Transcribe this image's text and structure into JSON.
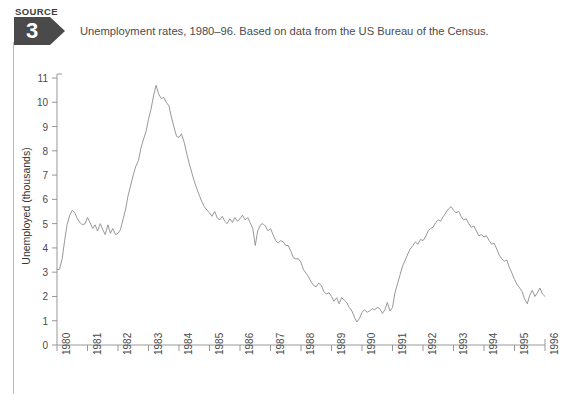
{
  "source_badge": {
    "word": "SOURCE",
    "number": "3"
  },
  "caption": "Unemployment rates, 1980–96. Based on data from the US Bureau of the Census.",
  "colors": {
    "badge": "#4a4a4a",
    "line": "#8c8c8c",
    "axis": "#8c8c8c",
    "text": "#4a4a4a",
    "rule": "#b9b9b9",
    "background": "#ffffff"
  },
  "chart_data": {
    "type": "line",
    "title": "Unemployment rates, 1980–96. Based on data from the US Bureau of the Census.",
    "xlabel": "",
    "ylabel": "Unemployed (thousands)",
    "xlim": [
      1980,
      1996
    ],
    "ylim": [
      0,
      11
    ],
    "grid": false,
    "legend": false,
    "ytick_labels": [
      "0",
      "1",
      "2",
      "3",
      "4",
      "5",
      "6",
      "7",
      "8",
      "9",
      "10",
      "11"
    ],
    "ytick_values": [
      0,
      1,
      2,
      3,
      4,
      5,
      6,
      7,
      8,
      9,
      10,
      11
    ],
    "xtick_labels": [
      "1980",
      "1981",
      "1982",
      "1983",
      "1984",
      "1985",
      "1986",
      "1987",
      "1988",
      "1989",
      "1990",
      "1991",
      "1992",
      "1993",
      "1994",
      "1995",
      "1996"
    ],
    "xtick_values": [
      1980,
      1981,
      1982,
      1983,
      1984,
      1985,
      1986,
      1987,
      1988,
      1989,
      1990,
      1991,
      1992,
      1993,
      1994,
      1995,
      1996
    ],
    "series": [
      {
        "name": "Unemployed (thousands)",
        "x": [
          1980.0,
          1980.08,
          1980.17,
          1980.25,
          1980.33,
          1980.42,
          1980.5,
          1980.58,
          1980.67,
          1980.75,
          1980.83,
          1980.92,
          1981.0,
          1981.08,
          1981.17,
          1981.25,
          1981.33,
          1981.42,
          1981.5,
          1981.58,
          1981.67,
          1981.75,
          1981.83,
          1981.92,
          1982.0,
          1982.08,
          1982.17,
          1982.25,
          1982.33,
          1982.42,
          1982.5,
          1982.58,
          1982.67,
          1982.75,
          1982.83,
          1982.92,
          1983.0,
          1983.08,
          1983.17,
          1983.25,
          1983.33,
          1983.42,
          1983.5,
          1983.58,
          1983.67,
          1983.75,
          1983.83,
          1983.92,
          1984.0,
          1984.08,
          1984.17,
          1984.25,
          1984.33,
          1984.42,
          1984.5,
          1984.58,
          1984.67,
          1984.75,
          1984.83,
          1984.92,
          1985.0,
          1985.08,
          1985.17,
          1985.25,
          1985.33,
          1985.42,
          1985.5,
          1985.58,
          1985.67,
          1985.75,
          1985.83,
          1985.92,
          1986.0,
          1986.08,
          1986.17,
          1986.25,
          1986.33,
          1986.42,
          1986.5,
          1986.58,
          1986.67,
          1986.75,
          1986.83,
          1986.92,
          1987.0,
          1987.08,
          1987.17,
          1987.25,
          1987.33,
          1987.42,
          1987.5,
          1987.58,
          1987.67,
          1987.75,
          1987.83,
          1987.92,
          1988.0,
          1988.08,
          1988.17,
          1988.25,
          1988.33,
          1988.42,
          1988.5,
          1988.58,
          1988.67,
          1988.75,
          1988.83,
          1988.92,
          1989.0,
          1989.08,
          1989.17,
          1989.25,
          1989.33,
          1989.42,
          1989.5,
          1989.58,
          1989.67,
          1989.75,
          1989.83,
          1989.92,
          1990.0,
          1990.08,
          1990.17,
          1990.25,
          1990.33,
          1990.42,
          1990.5,
          1990.58,
          1990.67,
          1990.75,
          1990.83,
          1990.92,
          1991.0,
          1991.08,
          1991.17,
          1991.25,
          1991.33,
          1991.42,
          1991.5,
          1991.58,
          1991.67,
          1991.75,
          1991.83,
          1991.92,
          1992.0,
          1992.08,
          1992.17,
          1992.25,
          1992.33,
          1992.42,
          1992.5,
          1992.58,
          1992.67,
          1992.75,
          1992.83,
          1992.92,
          1993.0,
          1993.08,
          1993.17,
          1993.25,
          1993.33,
          1993.42,
          1993.5,
          1993.58,
          1993.67,
          1993.75,
          1993.83,
          1993.92,
          1994.0,
          1994.08,
          1994.17,
          1994.25,
          1994.33,
          1994.42,
          1994.5,
          1994.58,
          1994.67,
          1994.75,
          1994.83,
          1994.92,
          1995.0,
          1995.08,
          1995.17,
          1995.25,
          1995.33,
          1995.42,
          1995.5,
          1995.58,
          1995.67,
          1995.75,
          1995.83,
          1995.92,
          1996.0
        ],
        "values": [
          3.1,
          3.12,
          3.55,
          4.3,
          4.95,
          5.35,
          5.55,
          5.45,
          5.2,
          5.05,
          4.95,
          5.0,
          5.25,
          5.05,
          4.8,
          4.95,
          4.7,
          5.0,
          4.75,
          4.55,
          4.95,
          4.6,
          4.8,
          4.55,
          4.6,
          4.75,
          5.2,
          5.6,
          6.15,
          6.6,
          7.0,
          7.35,
          7.6,
          8.1,
          8.45,
          8.8,
          9.3,
          9.7,
          10.3,
          10.7,
          10.35,
          10.15,
          10.2,
          10.0,
          9.85,
          9.4,
          9.0,
          8.6,
          8.55,
          8.7,
          8.35,
          7.9,
          7.5,
          7.1,
          6.75,
          6.45,
          6.15,
          5.9,
          5.7,
          5.55,
          5.45,
          5.3,
          5.5,
          5.25,
          5.15,
          5.3,
          5.1,
          5.0,
          5.2,
          5.05,
          5.25,
          5.1,
          5.2,
          5.35,
          5.15,
          5.25,
          5.05,
          4.8,
          4.1,
          4.7,
          4.95,
          5.0,
          4.9,
          4.7,
          4.8,
          4.55,
          4.3,
          4.2,
          4.3,
          4.25,
          4.1,
          4.1,
          3.85,
          3.6,
          3.55,
          3.55,
          3.4,
          3.1,
          2.95,
          2.8,
          2.6,
          2.45,
          2.4,
          2.55,
          2.45,
          2.2,
          2.1,
          2.15,
          2.0,
          1.8,
          1.95,
          1.7,
          1.95,
          1.85,
          1.75,
          1.55,
          1.4,
          1.15,
          0.95,
          1.1,
          1.35,
          1.45,
          1.35,
          1.4,
          1.5,
          1.45,
          1.55,
          1.5,
          1.3,
          1.45,
          1.75,
          1.4,
          1.55,
          2.15,
          2.55,
          2.9,
          3.25,
          3.5,
          3.75,
          3.95,
          4.1,
          4.25,
          4.15,
          4.35,
          4.3,
          4.45,
          4.7,
          4.8,
          4.85,
          5.05,
          5.15,
          5.1,
          5.3,
          5.45,
          5.6,
          5.7,
          5.55,
          5.45,
          5.5,
          5.3,
          5.15,
          5.2,
          5.0,
          4.85,
          4.9,
          4.7,
          4.5,
          4.55,
          4.45,
          4.5,
          4.3,
          4.15,
          4.2,
          3.95,
          3.7,
          3.55,
          3.45,
          3.5,
          3.2,
          2.95,
          2.7,
          2.5,
          2.35,
          2.2,
          1.9,
          1.7,
          2.05,
          2.25,
          2.0,
          2.15,
          2.35,
          2.1,
          2.0
        ]
      }
    ]
  }
}
